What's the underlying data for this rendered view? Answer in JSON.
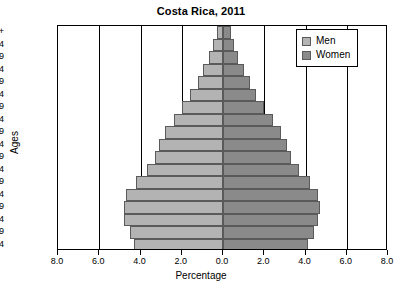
{
  "chart_data": {
    "type": "bar",
    "subtype": "population-pyramid",
    "title": "Costa Rica, 2011",
    "xlabel": "Percentage",
    "ylabel": "Ages",
    "xlim": [
      -8.0,
      8.0
    ],
    "xticks": [
      -8.0,
      -6.0,
      -4.0,
      -2.0,
      0.0,
      2.0,
      4.0,
      6.0,
      8.0
    ],
    "xticklabels": [
      "8.0",
      "6.0",
      "4.0",
      "2.0",
      "0.0",
      "2.0",
      "4.0",
      "6.0",
      "8.0"
    ],
    "grid": true,
    "grid_axis": "x",
    "legend_position": "top-right",
    "categories": [
      "0-4",
      "5-9",
      "10-14",
      "15-19",
      "20-24",
      "25-29",
      "30-34",
      "35-39",
      "40-44",
      "45-49",
      "50-54",
      "55-59",
      "60-64",
      "65-69",
      "70-74",
      "75-79",
      "80-84",
      "85+"
    ],
    "series": [
      {
        "name": "Men",
        "color": "#b3b3b3",
        "side": "left",
        "values": [
          4.3,
          4.5,
          4.8,
          4.8,
          4.7,
          4.2,
          3.7,
          3.3,
          3.1,
          2.8,
          2.4,
          2.0,
          1.6,
          1.2,
          0.95,
          0.7,
          0.5,
          0.3
        ]
      },
      {
        "name": "Women",
        "color": "#8a8a8a",
        "side": "right",
        "values": [
          4.1,
          4.4,
          4.6,
          4.7,
          4.6,
          4.2,
          3.7,
          3.3,
          3.1,
          2.8,
          2.4,
          2.0,
          1.6,
          1.3,
          1.0,
          0.75,
          0.55,
          0.4
        ]
      }
    ]
  },
  "legend": {
    "items": [
      {
        "label": "Men",
        "color": "#b3b3b3"
      },
      {
        "label": "Women",
        "color": "#8a8a8a"
      }
    ]
  },
  "colors": {
    "men": "#b3b3b3",
    "women": "#8a8a8a",
    "axis": "#000000",
    "bar_border": "#5a5a5a",
    "background": "#ffffff"
  }
}
